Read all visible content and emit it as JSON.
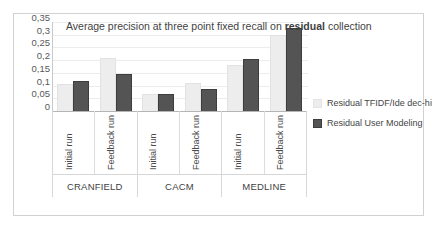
{
  "chart_data": {
    "type": "bar",
    "title": "Average  precision at three point fixed recall on residual collection",
    "title_parts": {
      "before": "Average  precision at three point fixed recall on ",
      "bold": "residual",
      "after": " collection"
    },
    "xlabel": "",
    "ylabel": "",
    "ylim": [
      0,
      0.35
    ],
    "grid": true,
    "legend_position": "right",
    "ytick_labels": [
      "0,35",
      "0,3",
      "0,25",
      "0,2",
      "0,15",
      "0,1",
      "0,05",
      "0"
    ],
    "ytick_values": [
      0.35,
      0.3,
      0.25,
      0.2,
      0.15,
      0.1,
      0.05,
      0
    ],
    "groups": [
      "CRANFIELD",
      "CACM",
      "MEDLINE"
    ],
    "run_labels": [
      "Initial run",
      "Feedback run"
    ],
    "categories": [
      "CRANFIELD / Initial run",
      "CRANFIELD / Feedback run",
      "CACM / Initial run",
      "CACM / Feedback run",
      "MEDLINE / Initial run",
      "MEDLINE / Feedback run"
    ],
    "series": [
      {
        "name": "Residual TFIDF/Ide dec-hi",
        "color": "#ededed",
        "values": [
          0.105,
          0.21,
          0.065,
          0.11,
          0.18,
          0.3
        ]
      },
      {
        "name": "Residual User Modeling",
        "color": "#545454",
        "values": [
          0.12,
          0.145,
          0.065,
          0.085,
          0.205,
          0.325
        ]
      }
    ]
  },
  "legend": {
    "items": [
      {
        "label": "Residual TFIDF/Ide dec-hi"
      },
      {
        "label": "Residual User Modeling"
      }
    ]
  }
}
